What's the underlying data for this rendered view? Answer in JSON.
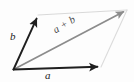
{
  "figure": {
    "type": "vector-parallelogram-diagram",
    "width": 134,
    "height": 82,
    "background_color": "#fdfdfd",
    "labels": {
      "vector_a": "a",
      "vector_b": "b",
      "vector_sum": "a + b"
    },
    "colors": {
      "vector_a_stroke": "#1f1f1f",
      "vector_b_stroke": "#1f1f1f",
      "vector_sum_stroke": "#8c8c8c",
      "parallelogram_edge": "#d6d6d6",
      "label_text": "#242424",
      "sum_label_text": "#4a4a4a"
    },
    "geometry": {
      "origin": [
        13,
        70
      ],
      "tip_a": [
        101,
        67
      ],
      "tip_b": [
        38,
        15
      ],
      "tip_sum": [
        127,
        10
      ]
    }
  }
}
